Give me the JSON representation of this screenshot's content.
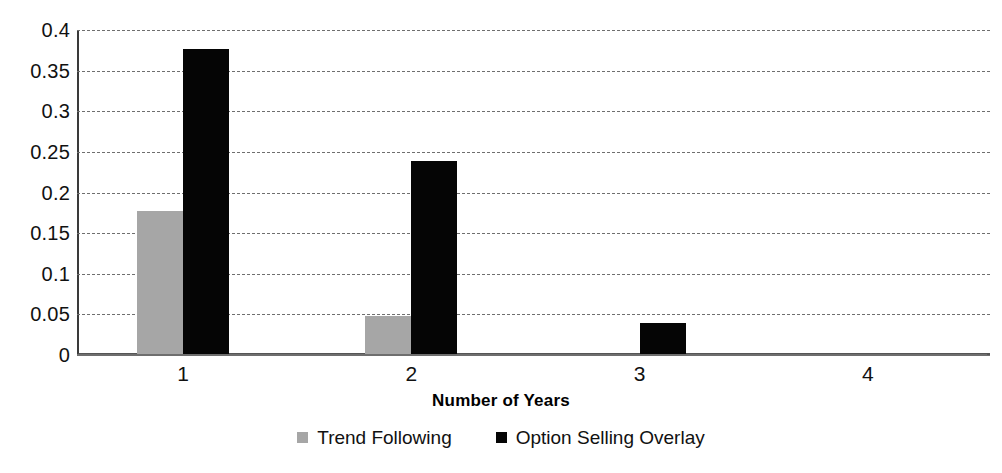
{
  "chart_data": {
    "type": "bar",
    "title": "",
    "xlabel": "Number of Years",
    "ylabel": "",
    "categories": [
      "1",
      "2",
      "3",
      "4"
    ],
    "series": [
      {
        "name": "Trend Following",
        "color": "#a6a6a6",
        "values": [
          0.177,
          0.0485,
          0,
          0
        ]
      },
      {
        "name": "Option Selling Overlay",
        "color": "#050505",
        "values": [
          0.3765,
          0.2385,
          0.04,
          0
        ]
      }
    ],
    "ylim": [
      0,
      0.4
    ],
    "ytick_labels": [
      "0.4",
      "0.35",
      "0.3",
      "0.25",
      "0.2",
      "0.15",
      "0.1",
      "0.05",
      "0"
    ],
    "ytick_values": [
      0.4,
      0.35,
      0.3,
      0.25,
      0.2,
      0.15,
      0.1,
      0.05,
      0
    ],
    "grid": true,
    "grid_style": "dashed-horizontal",
    "legend_position": "bottom-center"
  }
}
